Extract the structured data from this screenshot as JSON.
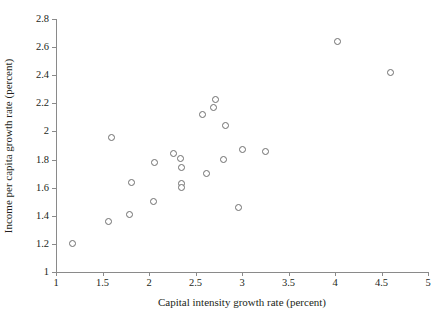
{
  "chart_data": {
    "type": "scatter",
    "title": "",
    "xlabel": "Capital intensity growth rate (percent)",
    "ylabel": "Income per capita growth rate (percent)",
    "xlim": [
      1,
      5
    ],
    "ylim": [
      1,
      2.8
    ],
    "xticks": [
      1,
      1.5,
      2,
      2.5,
      3,
      3.5,
      4,
      4.5,
      5
    ],
    "xticklabels": [
      "1",
      "1.5",
      "2",
      "2.5",
      "3",
      "3.5",
      "4",
      "4.5",
      "5"
    ],
    "yticks": [
      1,
      1.2,
      1.4,
      1.6,
      1.8,
      2,
      2.2,
      2.4,
      2.6,
      2.8
    ],
    "yticklabels": [
      "1",
      "1.2",
      "1.4",
      "1.6",
      "1.8",
      "2",
      "2.2",
      "2.4",
      "2.6",
      "2.8"
    ],
    "grid": false,
    "legend": null,
    "marker": "open-circle",
    "marker_color": "#6e6e6e",
    "axis_color": "#8a8a8a",
    "points": [
      {
        "x": 1.18,
        "y": 1.2
      },
      {
        "x": 1.56,
        "y": 1.36
      },
      {
        "x": 1.6,
        "y": 1.96
      },
      {
        "x": 1.79,
        "y": 1.41
      },
      {
        "x": 1.81,
        "y": 1.64
      },
      {
        "x": 2.05,
        "y": 1.5
      },
      {
        "x": 2.06,
        "y": 1.78
      },
      {
        "x": 2.26,
        "y": 1.84
      },
      {
        "x": 2.34,
        "y": 1.81
      },
      {
        "x": 2.35,
        "y": 1.74
      },
      {
        "x": 2.35,
        "y": 1.63
      },
      {
        "x": 2.35,
        "y": 1.6
      },
      {
        "x": 2.58,
        "y": 2.12
      },
      {
        "x": 2.62,
        "y": 1.7
      },
      {
        "x": 2.69,
        "y": 2.17
      },
      {
        "x": 2.72,
        "y": 2.23
      },
      {
        "x": 2.8,
        "y": 1.8
      },
      {
        "x": 2.82,
        "y": 2.04
      },
      {
        "x": 2.96,
        "y": 1.46
      },
      {
        "x": 3.01,
        "y": 1.87
      },
      {
        "x": 3.25,
        "y": 1.86
      },
      {
        "x": 4.03,
        "y": 2.64
      },
      {
        "x": 4.6,
        "y": 2.42
      }
    ]
  }
}
